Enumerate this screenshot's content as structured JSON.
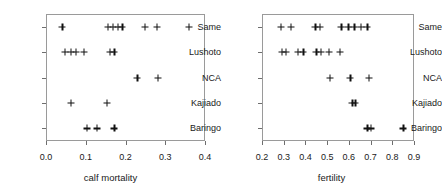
{
  "figure": {
    "width": 442,
    "height": 194,
    "background": "#ffffff",
    "marker_color": "#111111",
    "axis_color": "#9a9a9a"
  },
  "chart_data": [
    {
      "type": "scatter",
      "panel": "left",
      "title": "",
      "xlabel": "calf mortality",
      "ylabel": "",
      "xlim": [
        0.0,
        0.4
      ],
      "xticks": [
        0.0,
        0.1,
        0.2,
        0.3,
        0.4
      ],
      "xticklabels": [
        "0.0",
        "0.1",
        "0.2",
        "0.3",
        "0.4"
      ],
      "categories": [
        "Same",
        "Lushoto",
        "NCA",
        "Kajiado",
        "Baringo"
      ],
      "grid": false,
      "legend": "none",
      "series": [
        {
          "name": "Same",
          "values": [
            0.041,
            0.155,
            0.168,
            0.18,
            0.192,
            0.248,
            0.278,
            0.36
          ]
        },
        {
          "name": "Lushoto",
          "values": [
            0.047,
            0.062,
            0.075,
            0.095,
            0.16,
            0.172
          ]
        },
        {
          "name": "NCA",
          "values": [
            0.23,
            0.282
          ]
        },
        {
          "name": "Kajiado",
          "values": [
            0.063,
            0.153
          ]
        },
        {
          "name": "Baringo",
          "values": [
            0.102,
            0.128,
            0.172
          ]
        }
      ]
    },
    {
      "type": "scatter",
      "panel": "right",
      "title": "",
      "xlabel": "fertility",
      "ylabel": "",
      "xlim": [
        0.2,
        0.9
      ],
      "xticks": [
        0.2,
        0.3,
        0.4,
        0.5,
        0.6,
        0.7,
        0.8,
        0.9
      ],
      "xticklabels": [
        "0.2",
        "0.3",
        "0.4",
        "0.5",
        "0.6",
        "0.7",
        "0.8",
        "0.9"
      ],
      "categories": [
        "Same",
        "Lushoto",
        "NCA",
        "Kajiado",
        "Baringo"
      ],
      "grid": false,
      "legend": "none",
      "series": [
        {
          "name": "Same",
          "values": [
            0.287,
            0.332,
            0.445,
            0.465,
            0.565,
            0.597,
            0.625,
            0.655,
            0.685
          ]
        },
        {
          "name": "Lushoto",
          "values": [
            0.29,
            0.31,
            0.365,
            0.39,
            0.45,
            0.47,
            0.507,
            0.557
          ]
        },
        {
          "name": "NCA",
          "values": [
            0.513,
            0.607,
            0.693
          ]
        },
        {
          "name": "Kajiado",
          "values": [
            0.615,
            0.63
          ]
        },
        {
          "name": "Baringo",
          "values": [
            0.685,
            0.7,
            0.85
          ]
        }
      ]
    }
  ]
}
